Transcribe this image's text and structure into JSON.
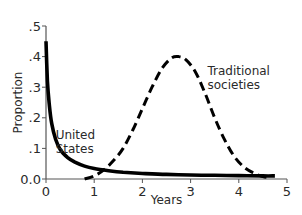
{
  "chart_data": {
    "type": "line",
    "title": "",
    "xlabel": "Years",
    "ylabel": "Proportion",
    "xlim": [
      0,
      5
    ],
    "ylim": [
      0,
      0.5
    ],
    "x_ticks": [
      0,
      1,
      2,
      3,
      4,
      5
    ],
    "x_tick_labels": [
      "0",
      "1",
      "2",
      "3",
      "4",
      "5"
    ],
    "y_ticks": [
      0,
      0.1,
      0.2,
      0.3,
      0.4,
      0.5
    ],
    "y_tick_labels": [
      "0.0",
      ".1",
      ".2",
      ".3",
      ".4",
      ".5"
    ],
    "grid": false,
    "legend": null,
    "series": [
      {
        "name": "United States",
        "style": "solid",
        "color": "#000000",
        "x": [
          0.0,
          0.03,
          0.07,
          0.12,
          0.2,
          0.3,
          0.45,
          0.6,
          0.8,
          1.0,
          1.3,
          1.6,
          2.0,
          2.5,
          3.0,
          3.5,
          4.0,
          4.5,
          4.75
        ],
        "y": [
          0.45,
          0.32,
          0.24,
          0.18,
          0.13,
          0.095,
          0.07,
          0.055,
          0.042,
          0.034,
          0.027,
          0.022,
          0.018,
          0.015,
          0.013,
          0.012,
          0.011,
          0.01,
          0.01
        ]
      },
      {
        "name": "Traditional societies",
        "style": "dashed",
        "color": "#000000",
        "x": [
          0.8,
          1.0,
          1.2,
          1.4,
          1.6,
          1.8,
          2.0,
          2.2,
          2.4,
          2.6,
          2.75,
          2.9,
          3.1,
          3.3,
          3.5,
          3.7,
          3.9,
          4.1,
          4.3,
          4.5,
          4.6
        ],
        "y": [
          0.0,
          0.01,
          0.03,
          0.06,
          0.1,
          0.16,
          0.23,
          0.3,
          0.36,
          0.395,
          0.4,
          0.39,
          0.35,
          0.28,
          0.2,
          0.13,
          0.075,
          0.04,
          0.02,
          0.008,
          0.005
        ]
      }
    ],
    "annotations": [
      {
        "text": [
          "United",
          "States"
        ],
        "x": 0.2,
        "y": 0.13
      },
      {
        "text": [
          "Traditional",
          "societies"
        ],
        "x": 3.35,
        "y": 0.34
      }
    ]
  }
}
